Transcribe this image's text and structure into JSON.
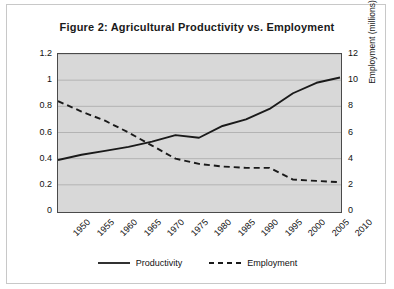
{
  "chart_data": {
    "type": "line",
    "title": "Figure 2: Agricultural Productivity vs. Employment",
    "xlabel": "",
    "x": [
      1950,
      1955,
      1960,
      1965,
      1970,
      1975,
      1980,
      1985,
      1990,
      1995,
      2000,
      2005,
      2010
    ],
    "xticklabels": [
      "1950",
      "1955",
      "1960",
      "1965",
      "1970",
      "1975",
      "1980",
      "1985",
      "1990",
      "1995",
      "2000",
      "2005",
      "2010"
    ],
    "grid": true,
    "legend_position": "bottom",
    "axes": {
      "left": {
        "label": "Productivity index (2005=1)",
        "ylim": [
          0,
          1.2
        ],
        "ticks": [
          0,
          0.2,
          0.4,
          0.6,
          0.8,
          1,
          1.2
        ],
        "ticklabels": [
          "0",
          "0.2",
          "0.4",
          "0.6",
          "0.8",
          "1",
          "1.2"
        ]
      },
      "right": {
        "label": "Employment (millions)",
        "ylim": [
          0,
          12
        ],
        "ticks": [
          0,
          2,
          4,
          6,
          8,
          10,
          12
        ],
        "ticklabels": [
          "0",
          "2",
          "4",
          "6",
          "8",
          "10",
          "12"
        ]
      }
    },
    "series": [
      {
        "name": "Productivity",
        "axis": "left",
        "style": "solid",
        "color": "#1a1a1a",
        "values": [
          0.39,
          0.43,
          0.46,
          0.49,
          0.53,
          0.58,
          0.56,
          0.65,
          0.7,
          0.78,
          0.9,
          0.98,
          1.02
        ]
      },
      {
        "name": "Employment",
        "axis": "right",
        "style": "dashed",
        "color": "#1a1a1a",
        "values": [
          8.4,
          7.6,
          6.9,
          6.0,
          5.0,
          4.0,
          3.6,
          3.4,
          3.3,
          3.3,
          2.4,
          2.3,
          2.2
        ]
      }
    ]
  },
  "legend": {
    "entries": [
      {
        "label": "Productivity"
      },
      {
        "label": "Employment"
      }
    ]
  },
  "colors": {
    "plot_background": "#d8d8d8",
    "gridline": "#b3b3b3",
    "axis_line": "#4a4a4a",
    "line": "#1a1a1a",
    "text": "#111111"
  }
}
